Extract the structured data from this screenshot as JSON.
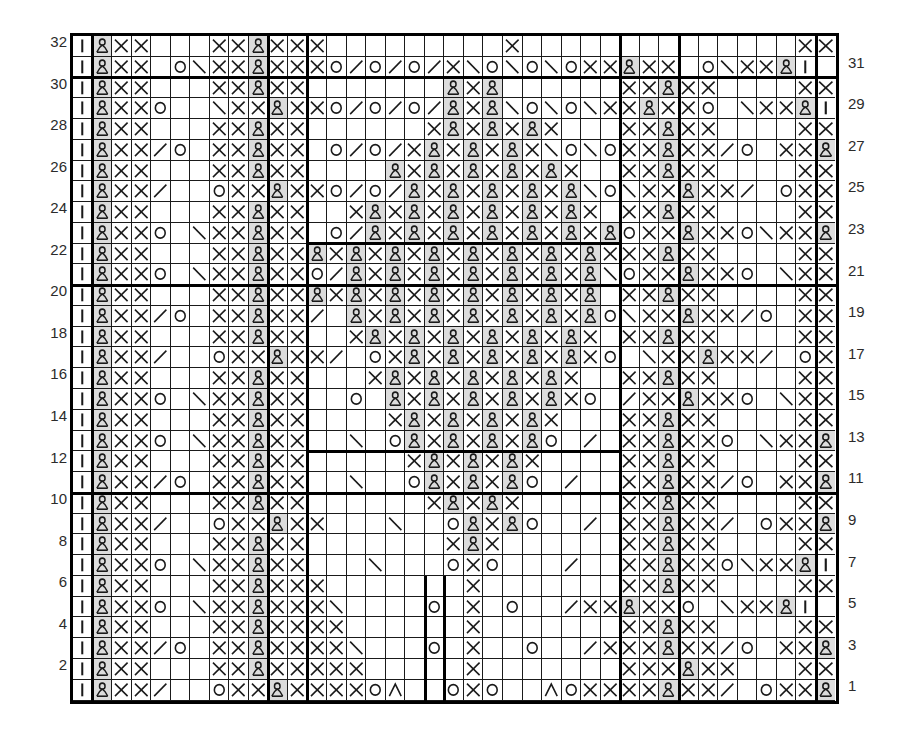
{
  "chart": {
    "type": "knitting-pattern-grid",
    "columns": 39,
    "rows": 32,
    "background_color": "#ffffff",
    "grid_line_color": "#1a1a1a",
    "repeat_line_color": "#000000",
    "shaded_cell_color": "#dcdcdc",
    "row_numbers_left": [
      "32",
      "30",
      "28",
      "26",
      "24",
      "22",
      "20",
      "18",
      "16",
      "14",
      "12",
      "10",
      "8",
      "6",
      "4",
      "2"
    ],
    "row_numbers_right": [
      "31",
      "29",
      "27",
      "25",
      "23",
      "21",
      "19",
      "17",
      "15",
      "13",
      "11",
      "9",
      "7",
      "5",
      "3",
      "1"
    ],
    "legend_symbols": {
      "I": "vertical-bar-purl",
      "X": "cross-knit",
      "P": "twisted-stitch",
      "O": "yarn-over-circle",
      "/": "right-slant-decrease",
      "\\": "left-slant-decrease",
      "A": "centered-double-decrease",
      ".": "empty-cell"
    },
    "vertical_repeat_lines_cols": [
      1,
      10,
      11,
      31,
      38
    ],
    "horizontal_repeat_lines_rows": [
      0,
      2,
      12,
      22,
      32
    ],
    "grid_rows": [
      "IPXX...XXPXXX.........X..............XXPI",
      "IPXX.O\\XXPXXXO/O/O/X\\O\\O\\OXXPXX.O\\XXPI",
      "IPXX...XXPXX.......PXP......XXPXX....XXPI",
      "IPXXO..\\XXPXXO/O/O/PXP\\O\\O\\XXPXXO.\\XXPI",
      "IPXX...XXPXX......XPXPXPX...XXPXX....XXPI",
      "IPXX/O.XXPXX.O/O/XPXPXPX\\O\\OXXPXX/O.XXPI",
      "IPXX...XXPXX....PXPXPXPXPX..XXPXX....XXPI",
      "IPXX/..OXXPXXO/O/PXPXPXPXP\\O\\XXPXX/.OXXPI",
      "IPXX...XXPXX..XPXPXPXPXPXPX.XXPXX....XXPI",
      "IPXXO.\\XXPXX.O/PXPXPXPXPXPXPOXXPXXO\\XXPI",
      "IPXX...XXPXXPXPXPXPXPXPXPXPXXXPXX....XXPI",
      "IPXXO.\\XXPXXO/PXPXPXPXPXPXP\\OXXPXXO.\\XXPI",
      "IPXX...XXPXXPXPXPXPXPXPXPXP.XXPXX....XXPI",
      "IPXX/O.XXPXX/.PXPXPXPXPXPXPO\\XXPXX/O.XXPI",
      "IPXX...XXPXX..XPXPXPXPXPXPX.XXPXX....XXPI",
      "IPXX/..OXXPXX/.OXPXPXPXPXPXO.\\XXPXX/.OXXPI",
      "IPXX...XXPXX...XPXPXPXPXPX..XXPXX....XXPI",
      "IPXXO.\\XXPXX..O.PXPXPXPXPXO./XXPXXO.\\XXPI",
      "IPXX...XXPXX....XPXPXPXPX...XXPXX....XXPI",
      "IPXXO.\\XXPXX..\\.OPXPXPXPO./.XXPXXO.\\XXPI",
      "IPXX...XXPXX.....XPXPXPX....XXPXX....XXPI",
      "IPXX/O.XXPXX..\\..OPXPXPO./..XXPXX/O.XXPI",
      "IPXX...XXPXX......XPXPX.....XXPXX....XXPI",
      "IPXX/..OXXPXX...\\..OPXPO../.XXPXX/.OXXPI",
      "IPXX...XXPXX.......XPX......XXPXX....XXPI",
      "IPXXO.\\XXPXX...\\...OXO.../..XXPXXO\\XXPI",
      "IPXX...XXPXXX.......X.......XXPXX....XXPI",
      "IPXXO.\\XXPXXX\\....O.X.O../XXPXXO.\\XXPI",
      "IPXX...XXPXXXX......X.......XXPXX....XXPI",
      "IPXX/O.XXPXXXX\\...O.X..O../XXXPXX/O.XXPI",
      "IPXX...XXPXXXXX.....X.......XXXPXX...XXPI",
      "IPXX/..OXXPXXXXOA..OXO..AOXXXXPXX/.OXXPI"
    ]
  }
}
